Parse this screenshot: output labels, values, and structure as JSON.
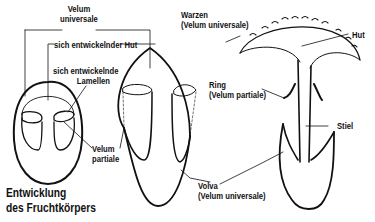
{
  "diagram": {
    "title_lines": [
      "Entwicklung",
      "des Fruchtkörpers"
    ],
    "labels": {
      "velum_universale_1": [
        "Velum",
        "universale"
      ],
      "sich_entwickelnder_hut": "sich entwickelnder Hut",
      "sich_entwickelnde_lamellen": [
        "sich entwickelnde",
        "Lamellen"
      ],
      "velum_partiale": [
        "Velum",
        "partiale"
      ],
      "warzen": [
        "Warzen",
        "(Velum universale)"
      ],
      "ring": [
        "Ring",
        "(Velum partiale)"
      ],
      "volva": [
        "Volva",
        "(Velum universale)"
      ],
      "hut": "Hut",
      "stiel": "Stiel"
    },
    "stages": [
      "egg-stage",
      "emerging-stage",
      "mature-mushroom"
    ],
    "colors": {
      "line": "#111111",
      "background": "#ffffff"
    }
  }
}
